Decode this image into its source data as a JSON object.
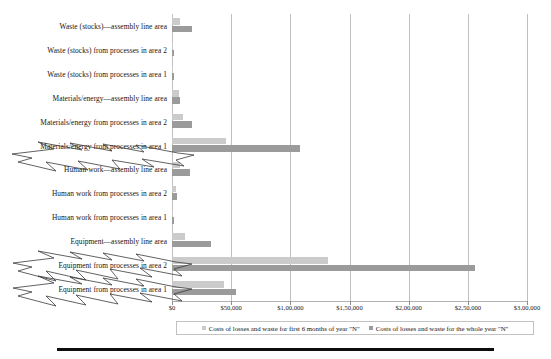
{
  "chart_data": {
    "type": "bar",
    "orientation": "horizontal",
    "title": "",
    "xlabel": "",
    "ylabel": "",
    "xlim": [
      0,
      300000
    ],
    "grid": true,
    "legend_position": "bottom",
    "xticks": [
      "$0",
      "$50,000",
      "$1,00,000",
      "$1,50,000",
      "$2,00,000",
      "$2,50,000",
      "$3,00,000"
    ],
    "xtick_values": [
      0,
      50000,
      100000,
      150000,
      200000,
      250000,
      300000
    ],
    "categories": [
      "Waste (stocks)—assembly line area",
      "Waste (stocks) from processes in area 2",
      "Waste (stocks) from processes in area 1",
      "Materials/energy—assembly line area",
      "Materials/energy from processes in area 2",
      "Materials/energy from processes in area 1",
      "Human work—assembly line area",
      "Human work from processes in area 2",
      "Human work from processes in area 1",
      "Equipment—assembly line area",
      "Equipment from processes in area 2",
      "Equipment from processes in area 1"
    ],
    "series": [
      {
        "name": "Costs of losses and waste for first 6 months of year \"N\"",
        "color": "#cbcbcb",
        "values": [
          7000,
          1000,
          1000,
          6000,
          9000,
          46000,
          7000,
          3000,
          1000,
          11000,
          132000,
          44000
        ]
      },
      {
        "name": "Costs of losses and waste for the whole year \"N\"",
        "color": "#9b9b9b",
        "values": [
          17000,
          1500,
          1500,
          6500,
          17000,
          108000,
          15000,
          4000,
          1500,
          33000,
          256000,
          54000
        ]
      }
    ],
    "highlighted_categories": [
      "Materials/energy from processes in area 1",
      "Equipment from processes in area 2",
      "Equipment from processes in area 1"
    ]
  },
  "legend": {
    "items": [
      {
        "label": "Costs of losses and waste for first 6 months of year \"N\"",
        "swatch": "s1"
      },
      {
        "label": "Costs of losses and waste for the whole year \"N\"",
        "swatch": "s2"
      }
    ]
  }
}
